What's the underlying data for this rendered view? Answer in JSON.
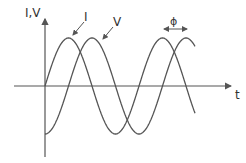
{
  "diagram": {
    "labels": {
      "y_axis": "I,V",
      "x_axis": "t",
      "current": "I",
      "voltage": "V",
      "phase": "ϕ"
    },
    "colors": {
      "stroke": "#555555",
      "text": "#333333",
      "background": "#ffffff"
    }
  },
  "chart_data": {
    "type": "line",
    "title": "",
    "xlabel": "t",
    "ylabel": "I,V",
    "series": [
      {
        "name": "I",
        "form": "sine",
        "amplitude": 1,
        "phase_offset": 0,
        "cycles_shown": 1.6
      },
      {
        "name": "V",
        "form": "sine",
        "amplitude": 1,
        "phase_offset": -0.25,
        "note": "V lags I by a quarter period",
        "cycles_shown": 1.6
      }
    ],
    "annotations": [
      {
        "text": "ϕ",
        "type": "double-arrow",
        "meaning": "phase difference between I and V peaks"
      }
    ],
    "grid": false,
    "legend": "inline labels with leader arrows"
  }
}
